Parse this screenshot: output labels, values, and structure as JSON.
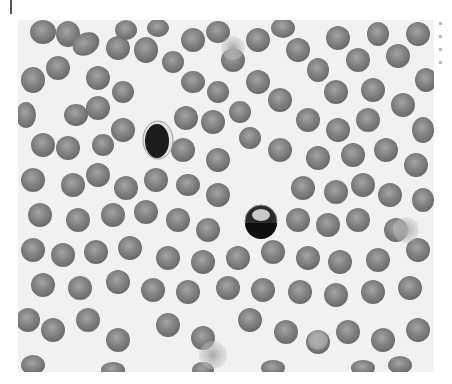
{
  "figure": {
    "type": "micrograph",
    "colormode": "grayscale",
    "background_color": "#f1f1f1",
    "rbc_color": "#7d7d7d",
    "rbc_pale_center": "#9a9a9a",
    "nucleus_color": "#1a1a1a"
  }
}
